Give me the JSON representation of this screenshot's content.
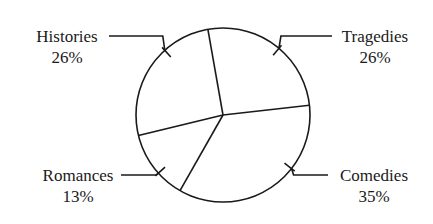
{
  "chart_data": {
    "type": "pie",
    "title": "",
    "categories": [
      "Tragedies",
      "Comedies",
      "Romances",
      "Histories"
    ],
    "values": [
      26,
      35,
      13,
      26
    ],
    "labels": [
      {
        "name": "Tragedies",
        "percent": "26%"
      },
      {
        "name": "Comedies",
        "percent": "35%"
      },
      {
        "name": "Romances",
        "percent": "13%"
      },
      {
        "name": "Histories",
        "percent": "26%"
      }
    ],
    "unit": "%",
    "legend": "none",
    "label_style": "leader-lines"
  },
  "colors": {
    "line": "#1a1a1a",
    "fill": "#ffffff"
  }
}
